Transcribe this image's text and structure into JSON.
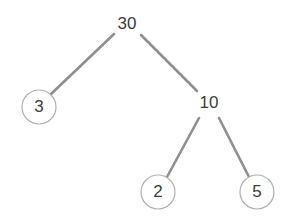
{
  "diagram": {
    "type": "binary-tree",
    "background_color": "#ffffff",
    "edge_color": "#8f8f8f",
    "edge_width": 2.6,
    "node_stroke_color": "#b0b0b0",
    "node_stroke_width": 1.2,
    "node_fill_color": "#ffffff",
    "text_color": "#3c3c3c",
    "font_size": 17,
    "nodes": [
      {
        "id": "root",
        "label": "30",
        "x": 127,
        "y": 24,
        "radius": 0,
        "circled": false,
        "level": 0
      },
      {
        "id": "left-child",
        "label": "3",
        "x": 39,
        "y": 107,
        "radius": 17,
        "circled": true,
        "level": 1
      },
      {
        "id": "right-child",
        "label": "10",
        "x": 209,
        "y": 103,
        "radius": 0,
        "circled": false,
        "level": 1
      },
      {
        "id": "right-left-child",
        "label": "2",
        "x": 158,
        "y": 192,
        "radius": 17,
        "circled": true,
        "level": 2
      },
      {
        "id": "right-right-child",
        "label": "5",
        "x": 257,
        "y": 192,
        "radius": 17,
        "circled": true,
        "level": 2
      }
    ],
    "edges": [
      {
        "id": "edge-30-3",
        "from": "30",
        "to": "3",
        "x1": 114,
        "y1": 34,
        "x2": 50,
        "y2": 95
      },
      {
        "id": "edge-30-10",
        "from": "30",
        "to": "10",
        "x1": 141,
        "y1": 35,
        "x2": 197,
        "y2": 91
      },
      {
        "id": "edge-10-2",
        "from": "10",
        "to": "2",
        "x1": 199,
        "y1": 118,
        "x2": 167,
        "y2": 177
      },
      {
        "id": "edge-10-5",
        "from": "10",
        "to": "5",
        "x1": 219,
        "y1": 118,
        "x2": 249,
        "y2": 177
      }
    ]
  }
}
